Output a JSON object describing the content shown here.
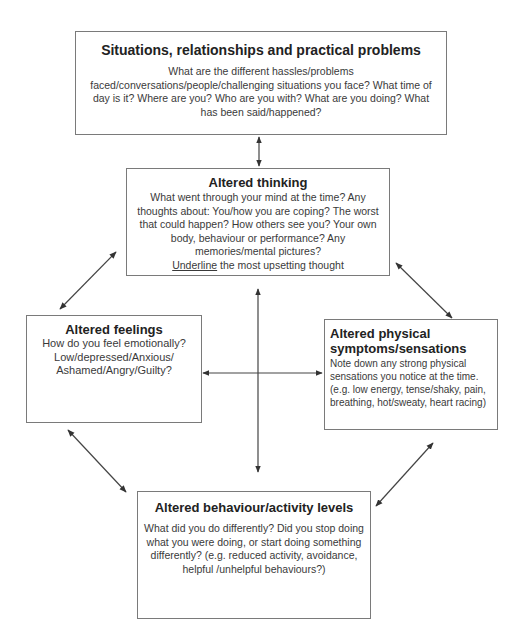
{
  "diagram": {
    "type": "five-areas-cbt-model",
    "boxes": {
      "situations": {
        "title": "Situations, relationships and practical problems",
        "body": "What are the different hassles/problems faced/conversations/people/challenging situations you face? What time of day is it? Where are you? Who are you with? What are you doing? What has been said/happened?"
      },
      "thinking": {
        "title": "Altered thinking",
        "body": "What went through your mind at the time? Any thoughts about: You/how you are coping? The worst that could happen? How others see you? Your own body, behaviour or performance? Any memories/mental pictures?",
        "underline_word": "Underline",
        "underline_rest": " the most upsetting thought"
      },
      "feelings": {
        "title": "Altered feelings",
        "body": "How do you feel emotionally? Low/depressed/Anxious/ Ashamed/Angry/Guilty?"
      },
      "physical": {
        "title": "Altered physical symptoms/sensations",
        "body": "Note down any strong physical sensations you notice at the time. (e.g. low energy, tense/shaky, pain, breathing, hot/sweaty, heart racing)"
      },
      "behaviour": {
        "title": "Altered behaviour/activity levels",
        "body": "What did you do differently? Did you stop doing what you were doing, or start doing something differently? (e.g. reduced activity, avoidance, helpful /unhelpful behaviours?)"
      }
    },
    "connections": [
      {
        "from": "situations",
        "to": "thinking",
        "bidirectional": true
      },
      {
        "from": "thinking",
        "to": "feelings",
        "bidirectional": true
      },
      {
        "from": "thinking",
        "to": "physical",
        "bidirectional": true
      },
      {
        "from": "feelings",
        "to": "behaviour",
        "bidirectional": true
      },
      {
        "from": "physical",
        "to": "behaviour",
        "bidirectional": true
      },
      {
        "from": "feelings",
        "to": "physical",
        "bidirectional": true
      },
      {
        "from": "thinking",
        "to": "behaviour",
        "bidirectional": true
      }
    ],
    "colors": {
      "border": "#7a7a7a",
      "arrow": "#333333",
      "text": "#2a2a2a"
    }
  }
}
